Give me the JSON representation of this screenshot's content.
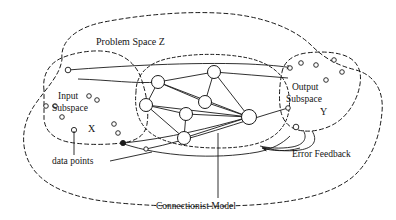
{
  "figure": {
    "background": "#ffffff",
    "ink": "#1a1a1a",
    "width": 396,
    "height": 220
  },
  "labels": {
    "problem_space": "Problem Space Z",
    "input_subspace_line1": "Input",
    "input_subspace_line2": "Subspace",
    "input_var": "X",
    "output_subspace_line1": "Output",
    "output_subspace_line2": "Subspace",
    "output_var": "Y",
    "data_points": "data points",
    "error_feedback": "Error Feedback",
    "connectionist_model": "Connectionist Model"
  },
  "regions": [
    {
      "name": "problem-space-z",
      "style": "dashed",
      "path": "M 62 59 C 60 40 78 27 104 22 C 140 15 190 10 232 14 C 268 18 296 30 312 46 C 326 60 340 66 356 70 C 374 75 384 90 382 112 C 380 136 372 158 356 174 C 336 193 300 202 252 205 C 196 208 132 206 96 200 C 62 194 40 182 30 164 C 20 146 22 124 34 106 C 46 88 60 76 62 59 Z"
    },
    {
      "name": "input-subspace",
      "style": "dashed",
      "path": "M 44 88 C 44 72 52 62 66 57 C 82 51 102 50 116 54 C 130 58 140 68 144 82 C 148 96 150 110 148 122 C 146 134 138 140 124 142 C 106 144 84 144 68 141 C 54 138 46 130 44 118 Z"
    },
    {
      "name": "output-subspace",
      "style": "dashed",
      "path": "M 292 60 C 298 54 312 52 328 54 C 344 56 354 62 358 72 C 362 82 360 96 352 108 C 344 120 330 128 314 130 C 300 132 290 128 286 118 C 282 106 282 90 284 76 C 285 68 288 63 292 60 Z"
    },
    {
      "name": "connectionist-model",
      "style": "dashed-tight",
      "path": "M 140 78 C 142 66 152 60 170 57 C 196 53 228 53 252 57 C 272 60 284 68 288 82 C 292 98 290 116 280 128 C 270 140 250 146 224 147 C 196 148 170 146 154 138 C 140 131 134 118 136 102 C 137 92 138 84 140 78 Z"
    }
  ],
  "network": {
    "nodes": [
      {
        "id": "n1",
        "cx": 158,
        "cy": 82,
        "r": 6.5
      },
      {
        "id": "n2",
        "cx": 214,
        "cy": 72,
        "r": 6.5
      },
      {
        "id": "n3",
        "cx": 146,
        "cy": 105,
        "r": 6.5
      },
      {
        "id": "n4",
        "cx": 205,
        "cy": 102,
        "r": 6.5
      },
      {
        "id": "n5",
        "cx": 186,
        "cy": 114,
        "r": 6.5
      },
      {
        "id": "n6",
        "cx": 249,
        "cy": 117,
        "r": 7.5
      },
      {
        "id": "n7",
        "cx": 184,
        "cy": 138,
        "r": 6.5
      }
    ],
    "edges": [
      [
        "n1",
        "n2"
      ],
      [
        "n1",
        "n3"
      ],
      [
        "n1",
        "n4"
      ],
      [
        "n1",
        "n6"
      ],
      [
        "n2",
        "n6"
      ],
      [
        "n2",
        "n4"
      ],
      [
        "n3",
        "n5"
      ],
      [
        "n3",
        "n7"
      ],
      [
        "n3",
        "n6"
      ],
      [
        "n4",
        "n6"
      ],
      [
        "n5",
        "n6"
      ],
      [
        "n5",
        "n7"
      ],
      [
        "n6",
        "n7"
      ]
    ]
  },
  "input_points": [
    {
      "cx": 46,
      "cy": 106,
      "r": 2.3
    },
    {
      "cx": 54,
      "cy": 106,
      "r": 2.3
    },
    {
      "cx": 62,
      "cy": 117,
      "r": 2.3
    },
    {
      "cx": 89,
      "cy": 96,
      "r": 2.3
    },
    {
      "cx": 97,
      "cy": 99,
      "r": 2.3
    },
    {
      "cx": 72,
      "cy": 130,
      "r": 2.3
    },
    {
      "cx": 114,
      "cy": 124,
      "r": 2.3
    },
    {
      "cx": 118,
      "cy": 132,
      "r": 2.3
    },
    {
      "cx": 66,
      "cy": 70,
      "r": 2.8
    }
  ],
  "output_points": [
    {
      "cx": 288,
      "cy": 66,
      "r": 2.3
    },
    {
      "cx": 300,
      "cy": 62,
      "r": 2.3
    },
    {
      "cx": 315,
      "cy": 64,
      "r": 2.3
    },
    {
      "cx": 334,
      "cy": 59,
      "r": 2.3
    },
    {
      "cx": 341,
      "cy": 70,
      "r": 2.3
    },
    {
      "cx": 324,
      "cy": 78,
      "r": 2.3
    },
    {
      "cx": 288,
      "cy": 108,
      "r": 2.3
    },
    {
      "cx": 296,
      "cy": 127,
      "r": 2.8
    }
  ],
  "marked_points": [
    {
      "cx": 122,
      "cy": 143,
      "r": 2.6,
      "filled": true
    },
    {
      "cx": 145,
      "cy": 149,
      "r": 2.2,
      "filled": false
    }
  ],
  "callouts": [
    {
      "name": "data-points-leader-vertical",
      "d": "M 74 133 L 74 154"
    },
    {
      "name": "data-points-leader-horizontal",
      "d": "M 108 160 L 150 152"
    },
    {
      "name": "connectionist-model-leader",
      "d": "M 218 134 L 218 196"
    }
  ],
  "annotations": {
    "problem_space_pos": {
      "x": 96,
      "y": 44
    },
    "input_pos": {
      "x": 58,
      "y": 99
    },
    "subspace_in_pos": {
      "x": 58,
      "y": 110
    },
    "input_var_pos": {
      "x": 87,
      "y": 131
    },
    "output_pos": {
      "x": 290,
      "y": 89
    },
    "subspace_out_pos": {
      "x": 286,
      "y": 101
    },
    "output_var_pos": {
      "x": 318,
      "y": 114
    },
    "data_points_pos": {
      "x": 53,
      "y": 163
    },
    "error_feedback_pos": {
      "x": 290,
      "y": 155
    },
    "connectionist_model_pos": {
      "x": 157,
      "y": 207
    }
  }
}
